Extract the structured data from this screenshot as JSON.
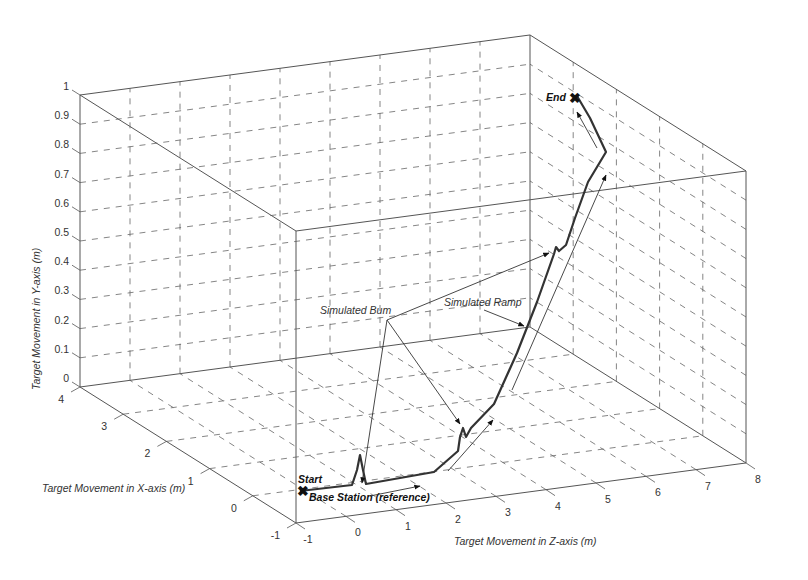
{
  "chart_data": {
    "type": "line3d",
    "title": "",
    "axes": {
      "x": {
        "label": "Target Movement in X-axis (m)",
        "range": [
          -1,
          4
        ],
        "ticks": [
          "-1",
          "0",
          "1",
          "2",
          "3",
          "4"
        ]
      },
      "y": {
        "label": "Target Movement in Y-axis (m)",
        "range": [
          0,
          1
        ],
        "ticks": [
          "0",
          "0.1",
          "0.2",
          "0.3",
          "0.4",
          "0.5",
          "0.6",
          "0.7",
          "0.8",
          "0.9",
          "1"
        ]
      },
      "z": {
        "label": "Target Movement in Z-axis (m)",
        "range": [
          -1,
          8
        ],
        "ticks": [
          "-1",
          "0",
          "1",
          "2",
          "3",
          "4",
          "5",
          "6",
          "7",
          "8"
        ]
      }
    },
    "grid": true,
    "series": [
      {
        "name": "Target trajectory",
        "points_xyz": [
          [
            0,
            0,
            -1
          ],
          [
            0,
            0,
            0.3
          ],
          [
            0,
            0.12,
            0.5
          ],
          [
            0,
            0,
            0.7
          ],
          [
            0,
            0,
            2.3
          ],
          [
            0.2,
            0.05,
            3.0
          ],
          [
            0.4,
            0.08,
            3.3
          ],
          [
            0.45,
            0.16,
            3.35
          ],
          [
            0.5,
            0.1,
            3.45
          ],
          [
            0.8,
            0.15,
            4.0
          ],
          [
            1.6,
            0.35,
            5.2
          ],
          [
            2.4,
            0.55,
            6.1
          ],
          [
            2.6,
            0.63,
            6.25
          ],
          [
            2.7,
            0.6,
            6.4
          ],
          [
            3.1,
            0.72,
            7.0
          ],
          [
            3.6,
            0.85,
            7.3
          ],
          [
            3.9,
            0.95,
            7.0
          ]
        ]
      }
    ],
    "annotations": [
      {
        "text": "Start",
        "at": [
          0,
          0,
          -1
        ]
      },
      {
        "text": "End",
        "at": [
          3.9,
          0.95,
          7.0
        ]
      },
      {
        "text": "Base Station (reference)",
        "at": [
          0,
          0,
          -1
        ]
      },
      {
        "text": "Simulated Bum",
        "points_to": [
          "bump at Z≈0.5",
          "bump at Z≈3.4",
          "bump at Z≈6.3"
        ]
      },
      {
        "text": "Simulated Ramp",
        "points_to": [
          "ramp section Z≈4.5–6"
        ]
      }
    ],
    "legend": null
  },
  "labels": {
    "start": "Start",
    "end": "End",
    "base_station": "Base Station (reference)",
    "bump": "Simulated Bum",
    "ramp": "Simulated Ramp",
    "xlabel": "Target Movement in X-axis (m)",
    "ylabel": "Target Movement in Y-axis (m)",
    "zlabel": "Target Movement in Z-axis (m)"
  }
}
